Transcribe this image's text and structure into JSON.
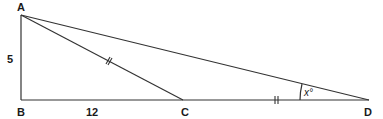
{
  "diagram": {
    "type": "geometry-triangle",
    "points": {
      "A": {
        "label": "A",
        "x": 21,
        "y": 15
      },
      "B": {
        "label": "B",
        "x": 21,
        "y": 100
      },
      "C": {
        "label": "C",
        "x": 183,
        "y": 100
      },
      "D": {
        "label": "D",
        "x": 369,
        "y": 100
      }
    },
    "segments": [
      {
        "from": "A",
        "to": "B",
        "length_label": "5"
      },
      {
        "from": "B",
        "to": "C",
        "length_label": "12"
      },
      {
        "from": "C",
        "to": "D",
        "tick_marks": 2
      },
      {
        "from": "A",
        "to": "C",
        "tick_marks": 2
      },
      {
        "from": "A",
        "to": "D"
      }
    ],
    "labels": {
      "ab_length": "5",
      "bc_length": "12",
      "angle_d": "x°"
    },
    "right_angle_at": "B",
    "colors": {
      "line": "#333333",
      "text": "#1a1a1a",
      "background": "#ffffff"
    }
  }
}
